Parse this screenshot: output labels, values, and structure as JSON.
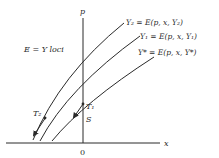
{
  "diagram": {
    "axes": {
      "x_label": "x",
      "y_label": "p",
      "origin_label": "0"
    },
    "region_label": "E = Y loci",
    "curves": [
      {
        "id": "Y2",
        "label": "Y₂ = E(p, x, Y₂)"
      },
      {
        "id": "Y1",
        "label": "Y₁ = E(p, x, Y₁)"
      },
      {
        "id": "Ystar",
        "label": "Y* = E(p, x, Y*)"
      }
    ],
    "points": {
      "T1": "T₁",
      "T2": "T₂",
      "S": "S"
    },
    "colors": {
      "ink": "#2a2a2a",
      "background": "#ffffff"
    }
  }
}
